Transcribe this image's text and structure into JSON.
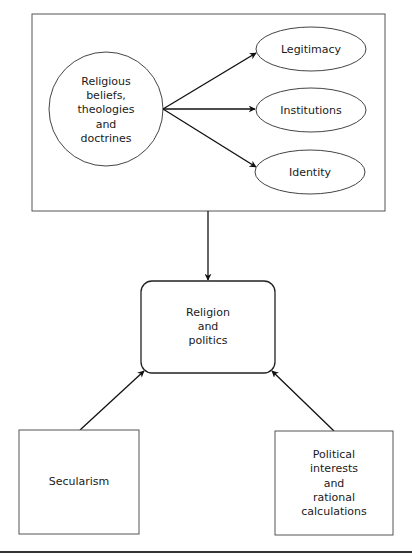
{
  "diagram": {
    "source_node": {
      "lines": [
        "Religious",
        "beliefs,",
        "theologies",
        "and",
        "doctrines"
      ]
    },
    "outcome_nodes": [
      {
        "label": "Legitimacy"
      },
      {
        "label": "Institutions"
      },
      {
        "label": "Identity"
      }
    ],
    "central_node": {
      "lines": [
        "Religion",
        "and",
        "politics"
      ]
    },
    "left_node": {
      "lines": [
        "Secularism"
      ]
    },
    "right_node": {
      "lines": [
        "Political",
        "interests",
        "and",
        "rational",
        "calculations"
      ]
    },
    "edges": [
      {
        "from": "source_node",
        "to": "Legitimacy"
      },
      {
        "from": "source_node",
        "to": "Institutions"
      },
      {
        "from": "source_node",
        "to": "Identity"
      },
      {
        "from": "top_group",
        "to": "central_node"
      },
      {
        "from": "left_node",
        "to": "central_node"
      },
      {
        "from": "right_node",
        "to": "central_node"
      }
    ]
  }
}
